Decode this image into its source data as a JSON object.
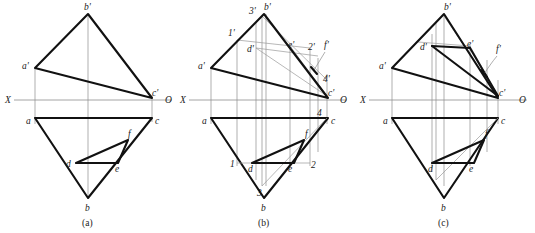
{
  "figure": {
    "colors": {
      "heavy_line": "#111111",
      "thin_line": "#8d8d8d",
      "axis_line": "#8d8d8d",
      "background": "#ffffff",
      "text": "#1a1a1a"
    }
  },
  "panels": [
    {
      "id": "a",
      "caption": "(a)",
      "axis": {
        "x_label": "X",
        "o_label": "O"
      },
      "labels": {
        "a_prime": "a'",
        "b_prime": "b'",
        "c_prime": "c'",
        "a": "a",
        "b": "b",
        "c": "c",
        "d": "d",
        "e": "e",
        "f": "f"
      }
    },
    {
      "id": "b",
      "caption": "(b)",
      "axis": {
        "x_label": "X",
        "o_label": "O"
      },
      "labels": {
        "a_prime": "a'",
        "b_prime": "b'",
        "c_prime": "c'",
        "d_prime": "d'",
        "e_prime": "e'",
        "f_prime": "f'",
        "one_prime": "1'",
        "two_prime": "2'",
        "three_prime": "3'",
        "four_prime": "4'",
        "a": "a",
        "b": "b",
        "c": "c",
        "d": "d",
        "e": "e",
        "f": "f",
        "one": "1",
        "two": "2",
        "three": "3",
        "four": "4"
      }
    },
    {
      "id": "c",
      "caption": "(c)",
      "axis": {
        "x_label": "X",
        "o_label": "O"
      },
      "labels": {
        "a_prime": "a'",
        "b_prime": "b'",
        "c_prime": "c'",
        "d_prime": "d'",
        "e_prime": "e'",
        "f_prime": "f'",
        "a": "a",
        "b": "b",
        "c": "c",
        "d": "d",
        "e": "e",
        "f": "f"
      }
    }
  ]
}
